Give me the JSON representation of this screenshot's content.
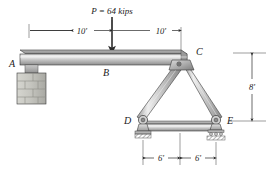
{
  "figure": {
    "name": "beam-truss-free-body-diagram",
    "load": {
      "label": "P = 64 kips",
      "magnitude": 64,
      "unit": "kips",
      "direction": "down"
    },
    "points": {
      "a": "A",
      "b": "B",
      "c": "C",
      "d": "D",
      "e": "E"
    },
    "dimensions": {
      "top_left": "10'",
      "top_right": "10'",
      "bottom_left": "6'",
      "bottom_right": "6'",
      "right_vertical": "8'"
    },
    "colors": {
      "member_light": "#e8e8e8",
      "member_mid": "#b9b9b9",
      "member_dark": "#8f8f8f",
      "outline": "#3a3a3a",
      "text": "#1a1a1a",
      "masonry": "#c9c9c4",
      "hatch": "#6e6e6e"
    }
  }
}
